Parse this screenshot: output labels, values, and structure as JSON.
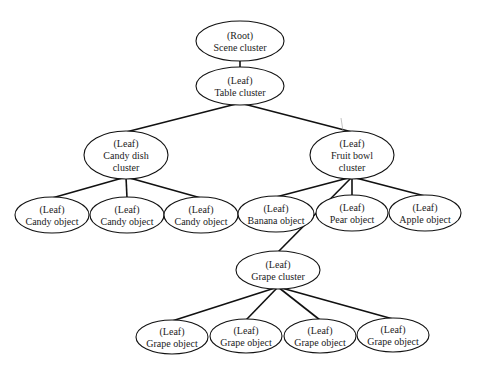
{
  "diagram": {
    "type": "tree",
    "nodes": [
      {
        "id": "root",
        "kind": "(Root)",
        "lines": [
          "Scene cluster"
        ],
        "cx": 240,
        "cy": 41,
        "rx": 44,
        "ry": 20
      },
      {
        "id": "table",
        "kind": "(Leaf)",
        "lines": [
          "Table cluster"
        ],
        "cx": 240,
        "cy": 86,
        "rx": 44,
        "ry": 19
      },
      {
        "id": "candydish",
        "kind": "(Leaf)",
        "lines": [
          "Candy dish",
          "cluster"
        ],
        "cx": 126,
        "cy": 155,
        "rx": 42,
        "ry": 24
      },
      {
        "id": "fruitbowl",
        "kind": "(Leaf)",
        "lines": [
          "Fruit bowl",
          "cluster"
        ],
        "cx": 352,
        "cy": 155,
        "rx": 42,
        "ry": 24
      },
      {
        "id": "candy1",
        "kind": "(Leaf)",
        "lines": [
          "Candy object"
        ],
        "cx": 52,
        "cy": 215,
        "rx": 37,
        "ry": 18
      },
      {
        "id": "candy2",
        "kind": "(Leaf)",
        "lines": [
          "Candy object"
        ],
        "cx": 127,
        "cy": 215,
        "rx": 37,
        "ry": 18
      },
      {
        "id": "candy3",
        "kind": "(Leaf)",
        "lines": [
          "Candy object"
        ],
        "cx": 201,
        "cy": 215,
        "rx": 37,
        "ry": 18
      },
      {
        "id": "banana",
        "kind": "(Leaf)",
        "lines": [
          "Banana object"
        ],
        "cx": 276,
        "cy": 214,
        "rx": 38,
        "ry": 18
      },
      {
        "id": "pear",
        "kind": "(Leaf)",
        "lines": [
          "Pear object"
        ],
        "cx": 352,
        "cy": 213,
        "rx": 36,
        "ry": 18
      },
      {
        "id": "apple",
        "kind": "(Leaf)",
        "lines": [
          "Apple object"
        ],
        "cx": 425,
        "cy": 213,
        "rx": 36,
        "ry": 18
      },
      {
        "id": "grapecluster",
        "kind": "(Leaf)",
        "lines": [
          "Grape cluster"
        ],
        "cx": 278,
        "cy": 270,
        "rx": 42,
        "ry": 19
      },
      {
        "id": "grape1",
        "kind": "(Leaf)",
        "lines": [
          "Grape object"
        ],
        "cx": 172,
        "cy": 337,
        "rx": 36,
        "ry": 17
      },
      {
        "id": "grape2",
        "kind": "(Leaf)",
        "lines": [
          "Grape object"
        ],
        "cx": 246,
        "cy": 336,
        "rx": 36,
        "ry": 17
      },
      {
        "id": "grape3",
        "kind": "(Leaf)",
        "lines": [
          "Grape object"
        ],
        "cx": 320,
        "cy": 336,
        "rx": 36,
        "ry": 17
      },
      {
        "id": "grape4",
        "kind": "(Leaf)",
        "lines": [
          "Grape object"
        ],
        "cx": 393,
        "cy": 335,
        "rx": 36,
        "ry": 17
      }
    ],
    "edges": [
      [
        "root",
        "table"
      ],
      [
        "table",
        "candydish"
      ],
      [
        "table",
        "fruitbowl"
      ],
      [
        "candydish",
        "candy1"
      ],
      [
        "candydish",
        "candy2"
      ],
      [
        "candydish",
        "candy3"
      ],
      [
        "fruitbowl",
        "banana"
      ],
      [
        "fruitbowl",
        "pear"
      ],
      [
        "fruitbowl",
        "apple"
      ],
      [
        "fruitbowl",
        "grapecluster"
      ],
      [
        "grapecluster",
        "grape1"
      ],
      [
        "grapecluster",
        "grape2"
      ],
      [
        "grapecluster",
        "grape3"
      ],
      [
        "grapecluster",
        "grape4"
      ]
    ]
  }
}
